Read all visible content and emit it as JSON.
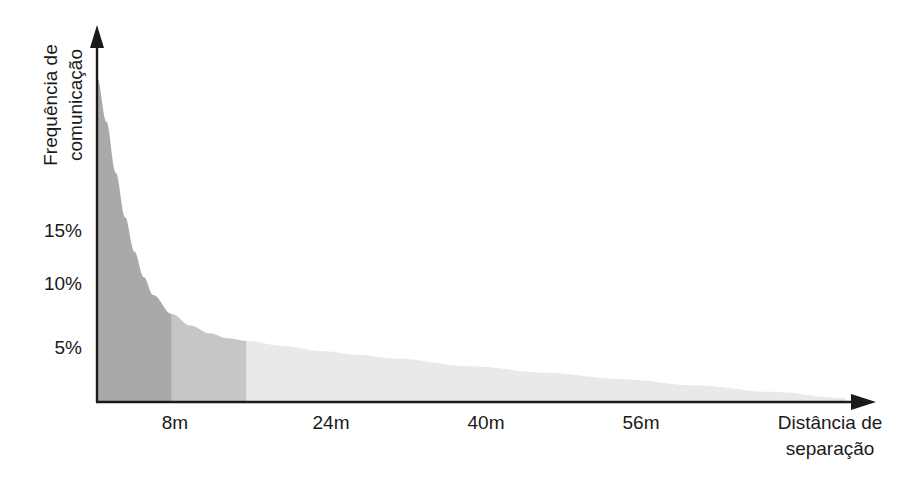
{
  "chart_data": {
    "type": "area",
    "title": "",
    "subtitle": "",
    "xlabel": "Distância de separação",
    "xlabel_lines": [
      "Distância de",
      "separação"
    ],
    "ylabel": "Frequência de comunicação",
    "ylabel_lines": [
      "Frequência de",
      "comunicação"
    ],
    "x_tick_labels": [
      "8m",
      "24m",
      "40m",
      "56m"
    ],
    "x_tick_values": [
      8,
      24,
      40,
      56
    ],
    "y_tick_labels": [
      "15%",
      "10%",
      "5%"
    ],
    "y_tick_values": [
      15,
      10,
      5
    ],
    "xlim": [
      0,
      80
    ],
    "ylim": [
      0,
      27
    ],
    "grid": false,
    "legend": false,
    "axis_arrows": true,
    "series_name": "Frequência de comunicação",
    "x": [
      0,
      1,
      2,
      3,
      4,
      5,
      6,
      8,
      10,
      12,
      14,
      16,
      20,
      24,
      28,
      32,
      40,
      48,
      56,
      64,
      72,
      80
    ],
    "values": [
      25.5,
      22.0,
      18.0,
      14.5,
      11.8,
      9.8,
      8.4,
      6.9,
      6.0,
      5.4,
      5.0,
      4.8,
      4.4,
      4.0,
      3.7,
      3.4,
      2.8,
      2.3,
      1.8,
      1.3,
      0.8,
      0.3
    ],
    "bands": [
      {
        "name": "near",
        "x_from": 0,
        "x_to": 8,
        "color": "#a9a9a9"
      },
      {
        "name": "middle",
        "x_from": 8,
        "x_to": 16,
        "color": "#c6c6c6"
      },
      {
        "name": "far",
        "x_from": 16,
        "x_to": 80,
        "color": "#e9e9e9"
      }
    ],
    "axis_color": "#1a1a1a",
    "background_color": "#ffffff"
  }
}
